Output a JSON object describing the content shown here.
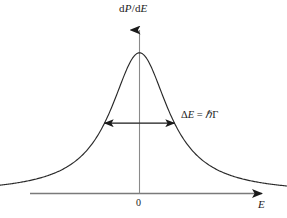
{
  "figure": {
    "kind": "line-plot",
    "background_color": "#ffffff",
    "ink_color": "#1a1a1a",
    "axis_color": "#6b6b6b",
    "curve_color": "#2b2b2b"
  },
  "labels": {
    "y_axis": "dP/dE",
    "y_axis_numerator": "d",
    "y_axis_numerator_var": "P",
    "y_axis_slash": "/d",
    "y_axis_denominator_var": "E",
    "x_axis": "E",
    "origin_tick": "0",
    "width_annotation": "ΔE = ℏΓ",
    "width_delta": "Δ",
    "width_var": "E",
    "width_equals": " = ",
    "width_hbar": "ℏ",
    "width_gamma": "Γ"
  },
  "chart_data": {
    "type": "line",
    "title": "",
    "xlabel": "E",
    "ylabel": "dP/dE",
    "grid": false,
    "legend": null,
    "annotations": [
      {
        "name": "fwhm-arrow",
        "text": "ΔE = ℏΓ",
        "kind": "double-headed-arrow",
        "meaning": "full width at half maximum",
        "x_from": -1.0,
        "x_to": 1.0,
        "y_level": 0.5
      }
    ],
    "tick_labels": {
      "x": [
        "0"
      ],
      "y": []
    },
    "xlim": [
      -6.2,
      6.2
    ],
    "ylim": [
      0,
      1.08
    ],
    "function": "lorentzian",
    "peak_x": 0,
    "peak_y": 1.0,
    "half_width_at_half_max": 1.0,
    "x": [
      -6.0,
      -5.5,
      -5.0,
      -4.5,
      -4.0,
      -3.5,
      -3.0,
      -2.5,
      -2.0,
      -1.75,
      -1.5,
      -1.25,
      -1.0,
      -0.85,
      -0.7,
      -0.55,
      -0.4,
      -0.25,
      -0.1,
      0.0,
      0.1,
      0.25,
      0.4,
      0.55,
      0.7,
      0.85,
      1.0,
      1.25,
      1.5,
      1.75,
      2.0,
      2.5,
      3.0,
      3.5,
      4.0,
      4.5,
      5.0,
      5.5,
      6.0
    ],
    "y": [
      0.027,
      0.032,
      0.038,
      0.047,
      0.059,
      0.075,
      0.1,
      0.138,
      0.2,
      0.246,
      0.308,
      0.39,
      0.5,
      0.58,
      0.671,
      0.768,
      0.862,
      0.941,
      0.99,
      1.0,
      0.99,
      0.941,
      0.862,
      0.768,
      0.671,
      0.58,
      0.5,
      0.39,
      0.308,
      0.246,
      0.2,
      0.138,
      0.1,
      0.075,
      0.059,
      0.047,
      0.038,
      0.032,
      0.027
    ]
  }
}
